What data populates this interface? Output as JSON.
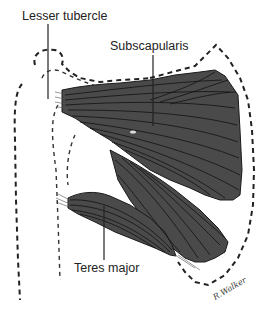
{
  "figure": {
    "labels": {
      "lesser_tubercle": "Lesser tubercle",
      "subscapularis": "Subscapularis",
      "teres_major": "Teres major"
    },
    "signature": "R.Walker",
    "colors": {
      "muscle_fill": "#4a4a4a",
      "fiber_line": "#111111",
      "outline": "#222222",
      "background": "#ffffff"
    }
  }
}
